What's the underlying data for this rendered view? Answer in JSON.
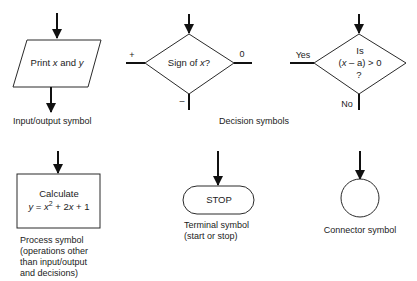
{
  "diagram": {
    "colors": {
      "stroke": "#2a2a2a",
      "arrow": "#111111",
      "text": "#222222",
      "background": "#ffffff"
    },
    "symbols": [
      {
        "id": "input-output",
        "shape": "parallelogram",
        "text": {
          "prefix": "Print ",
          "var1": "x",
          "mid": " and ",
          "var2": "y"
        },
        "caption": [
          "Input/output symbol"
        ]
      },
      {
        "id": "decision-sign",
        "shape": "diamond",
        "text": {
          "prefix": "Sign of ",
          "var": "x",
          "suffix": "?"
        },
        "branches": {
          "left": "+",
          "right": "0",
          "bottom": "–"
        }
      },
      {
        "id": "decision-compare",
        "shape": "diamond",
        "text": {
          "line1": "Is",
          "line2_open": "(",
          "line2_var": "x",
          "line2_rest": " – a) > 0",
          "line3": "?"
        },
        "branches": {
          "left": "Yes",
          "bottom": "No"
        }
      },
      {
        "id": "process",
        "shape": "rectangle",
        "text": {
          "line1": "Calculate",
          "line2_y": "y",
          "line2_eq": " = ",
          "line2_x": "x",
          "line2_sup": "2",
          "line2_mid": " + 2",
          "line2_x2": "x",
          "line2_end": " + 1"
        },
        "caption": [
          "Process symbol",
          "(operations other",
          "than input/output",
          "and decisions)"
        ]
      },
      {
        "id": "terminal",
        "shape": "rounded-rectangle",
        "text": {
          "label": "STOP"
        },
        "caption": [
          "Terminal symbol",
          "(start or stop)"
        ]
      },
      {
        "id": "connector",
        "shape": "circle",
        "caption": [
          "Connector symbol"
        ]
      }
    ],
    "group_captions": {
      "decision": "Decision symbols"
    }
  }
}
